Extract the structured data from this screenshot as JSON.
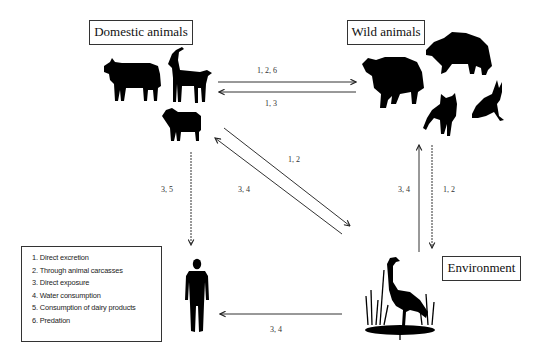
{
  "diagram": {
    "nodes": {
      "domestic": {
        "label": "Domestic animals",
        "icons": [
          "cow",
          "goat",
          "sheep"
        ]
      },
      "wild": {
        "label": "Wild animals",
        "icons": [
          "bear",
          "wild-boar",
          "fox",
          "hare"
        ]
      },
      "environment": {
        "label": "Environment",
        "icons": [
          "heron-in-reeds"
        ]
      },
      "human": {
        "label": "",
        "icons": [
          "human"
        ]
      }
    },
    "edges": [
      {
        "from": "domestic",
        "to": "wild",
        "label": "1, 2, 6"
      },
      {
        "from": "wild",
        "to": "domestic",
        "label": "1, 3"
      },
      {
        "from": "domestic",
        "to": "environment",
        "label": "1, 2"
      },
      {
        "from": "environment",
        "to": "domestic",
        "label": "3, 4"
      },
      {
        "from": "domestic",
        "to": "human",
        "label": "3, 5"
      },
      {
        "from": "environment",
        "to": "wild",
        "label": "3, 4"
      },
      {
        "from": "wild",
        "to": "environment",
        "label": "1, 2"
      },
      {
        "from": "environment",
        "to": "human",
        "label": "3, 4"
      }
    ],
    "legend": [
      "1. Direct excretion",
      "2. Through animal carcasses",
      "3. Direct exposure",
      "4. Water consumption",
      "5. Consumption of dairy products",
      "6. Predation"
    ]
  }
}
